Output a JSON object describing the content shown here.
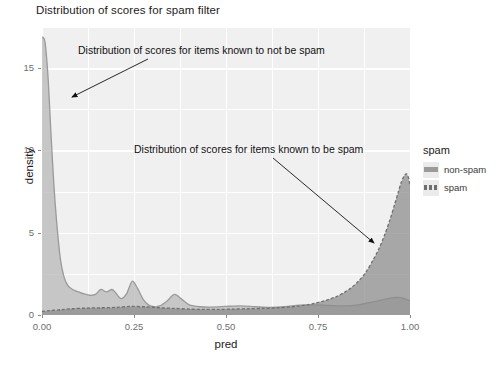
{
  "title": "Distribution of scores for spam filter",
  "axes": {
    "xlabel": "pred",
    "ylabel": "density",
    "xticks": [
      "0.00",
      "0.25",
      "0.50",
      "0.75",
      "1.00"
    ],
    "yticks": [
      "0",
      "5",
      "10",
      "15"
    ]
  },
  "legend": {
    "title": "spam",
    "items": [
      {
        "label": "non-spam",
        "color": "#9a9a9a",
        "dash": "solid"
      },
      {
        "label": "spam",
        "color": "#6f6f6f",
        "dash": "dashed"
      }
    ]
  },
  "annotations": [
    {
      "name": "non-spam",
      "text": "Distribution of scores for items known to not be spam"
    },
    {
      "name": "spam",
      "text": "Distribution of scores for items known to be spam"
    }
  ],
  "chart_data": {
    "type": "area",
    "title": "Distribution of scores for spam filter",
    "xlabel": "pred",
    "ylabel": "density",
    "xlim": [
      0.0,
      1.0
    ],
    "ylim": [
      0.0,
      17.5
    ],
    "grid": true,
    "legend_position": "right",
    "legend_title": "spam",
    "annotations": [
      {
        "text": "Distribution of scores for items known to not be spam",
        "text_xy": [
          0.115,
          15.6
        ],
        "arrow_to": [
          0.022,
          12.6
        ]
      },
      {
        "text": "Distribution of scores for items known to be spam",
        "text_xy": [
          0.265,
          9.5
        ],
        "arrow_to": [
          0.905,
          4.2
        ]
      }
    ],
    "series": [
      {
        "name": "non-spam",
        "fill": "#b5b5b5",
        "line": "#9a9a9a",
        "dash": "solid",
        "x": [
          0.0,
          0.008,
          0.016,
          0.024,
          0.032,
          0.04,
          0.05,
          0.06,
          0.07,
          0.08,
          0.09,
          0.1,
          0.115,
          0.13,
          0.145,
          0.16,
          0.175,
          0.19,
          0.2,
          0.215,
          0.23,
          0.245,
          0.26,
          0.275,
          0.29,
          0.305,
          0.32,
          0.34,
          0.36,
          0.38,
          0.4,
          0.43,
          0.46,
          0.5,
          0.54,
          0.58,
          0.62,
          0.66,
          0.7,
          0.74,
          0.78,
          0.82,
          0.86,
          0.9,
          0.93,
          0.955,
          0.975,
          0.99,
          1.0
        ],
        "y": [
          16.9,
          16.6,
          14.6,
          11.2,
          8.0,
          5.6,
          3.4,
          2.3,
          1.8,
          1.6,
          1.48,
          1.4,
          1.28,
          1.2,
          1.25,
          1.55,
          1.4,
          1.55,
          1.35,
          1.0,
          1.3,
          2.05,
          1.6,
          0.95,
          0.6,
          0.5,
          0.55,
          0.85,
          1.25,
          0.95,
          0.62,
          0.5,
          0.48,
          0.52,
          0.55,
          0.5,
          0.46,
          0.5,
          0.6,
          0.62,
          0.58,
          0.55,
          0.62,
          0.8,
          0.95,
          1.05,
          1.05,
          0.95,
          0.85
        ]
      },
      {
        "name": "spam",
        "fill": "#8a8a8a",
        "line": "#6f6f6f",
        "dash": "dashed",
        "x": [
          0.0,
          0.02,
          0.05,
          0.08,
          0.12,
          0.16,
          0.2,
          0.24,
          0.28,
          0.32,
          0.36,
          0.4,
          0.44,
          0.48,
          0.52,
          0.56,
          0.6,
          0.64,
          0.68,
          0.7,
          0.72,
          0.74,
          0.76,
          0.78,
          0.8,
          0.82,
          0.84,
          0.86,
          0.88,
          0.9,
          0.915,
          0.93,
          0.945,
          0.958,
          0.968,
          0.976,
          0.984,
          0.99,
          0.995,
          1.0
        ],
        "y": [
          0.22,
          0.26,
          0.32,
          0.38,
          0.42,
          0.44,
          0.46,
          0.52,
          0.5,
          0.44,
          0.4,
          0.36,
          0.34,
          0.34,
          0.36,
          0.38,
          0.4,
          0.44,
          0.5,
          0.55,
          0.62,
          0.7,
          0.82,
          0.95,
          1.12,
          1.35,
          1.65,
          2.05,
          2.6,
          3.35,
          4.0,
          4.8,
          5.75,
          6.7,
          7.45,
          8.05,
          8.45,
          8.58,
          8.4,
          7.9
        ]
      }
    ]
  }
}
